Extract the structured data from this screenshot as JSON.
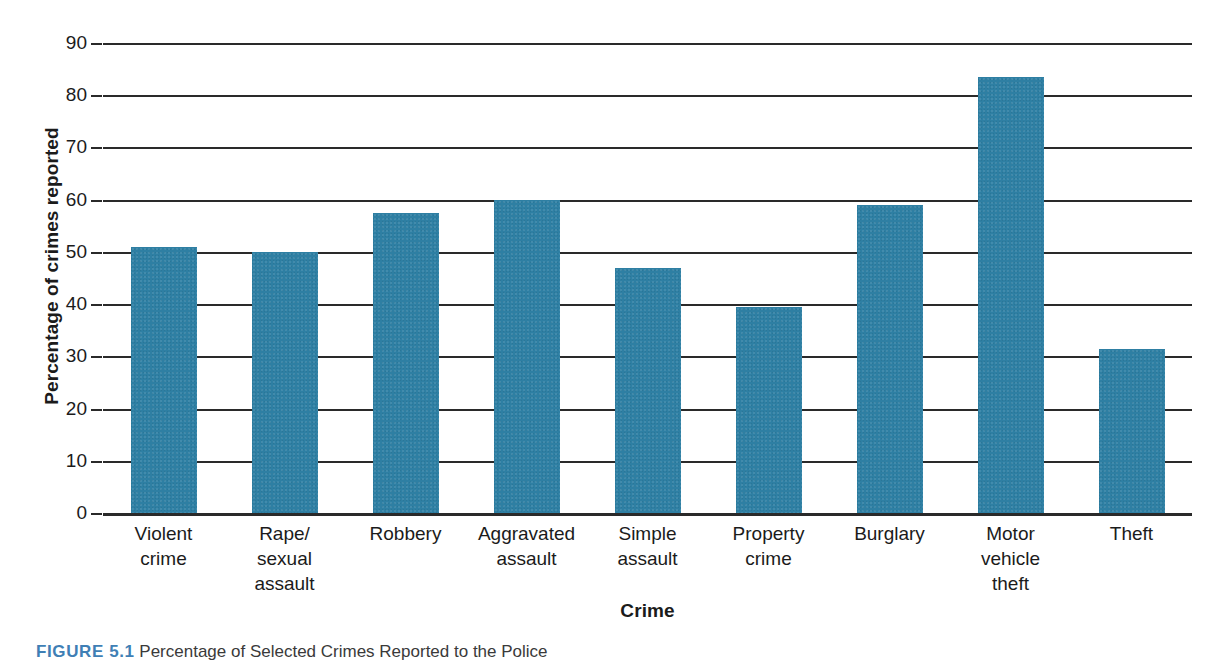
{
  "figure": {
    "caption_number": "FIGURE 5.1",
    "caption_text": "Percentage of Selected Crimes Reported to the Police"
  },
  "chart_data": {
    "type": "bar",
    "title": "",
    "xlabel": "Crime",
    "ylabel": "Percentage of crimes reported",
    "ylim": [
      0,
      90
    ],
    "ytick_step": 10,
    "ytick_labels": [
      "0",
      "10",
      "20",
      "30",
      "40",
      "50",
      "60",
      "70",
      "80",
      "90"
    ],
    "ytick_values": [
      0,
      10,
      20,
      30,
      40,
      50,
      60,
      70,
      80,
      90
    ],
    "grid": true,
    "legend": "none",
    "bar_color": "#2e7fa3",
    "axis_color": "#2a2a2a",
    "categories": [
      "Violent crime",
      "Rape/ sexual assault",
      "Robbery",
      "Aggravated assault",
      "Simple assault",
      "Property crime",
      "Burglary",
      "Motor vehicle theft",
      "Theft"
    ],
    "category_lines": [
      [
        "Violent",
        "crime"
      ],
      [
        "Rape/",
        "sexual",
        "assault"
      ],
      [
        "Robbery"
      ],
      [
        "Aggravated",
        "assault"
      ],
      [
        "Simple",
        "assault"
      ],
      [
        "Property",
        "crime"
      ],
      [
        "Burglary"
      ],
      [
        "Motor",
        "vehicle",
        "theft"
      ],
      [
        "Theft"
      ]
    ],
    "values": [
      51,
      50,
      57.5,
      60,
      47,
      39.5,
      59,
      83.5,
      31.5
    ]
  }
}
